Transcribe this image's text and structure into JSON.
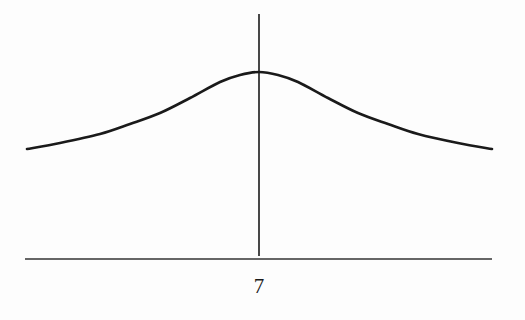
{
  "chart_data": {
    "type": "line",
    "title": "",
    "xlabel": "",
    "ylabel": "",
    "center_label": "7",
    "x_tick_labels": [
      "7"
    ],
    "grid": false,
    "legend": null,
    "series": [
      {
        "name": "density",
        "pixel_points": [
          [
            27,
            149
          ],
          [
            60,
            143
          ],
          [
            100,
            134
          ],
          [
            130,
            124
          ],
          [
            160,
            113
          ],
          [
            190,
            98
          ],
          [
            220,
            82
          ],
          [
            240,
            75
          ],
          [
            259,
            72
          ],
          [
            278,
            75
          ],
          [
            298,
            82
          ],
          [
            328,
            98
          ],
          [
            358,
            113
          ],
          [
            388,
            124
          ],
          [
            418,
            134
          ],
          [
            458,
            143
          ],
          [
            492,
            149
          ]
        ]
      }
    ],
    "vertical_line": {
      "x_label": "7",
      "pixel_x": 259,
      "pixel_y_top": 14,
      "pixel_y_bottom": 256
    },
    "x_axis": {
      "pixel_y": 259,
      "pixel_x_start": 25,
      "pixel_x_end": 492
    },
    "colors": {
      "line": "#1a1a1a",
      "background": "#fdfdfd"
    }
  }
}
